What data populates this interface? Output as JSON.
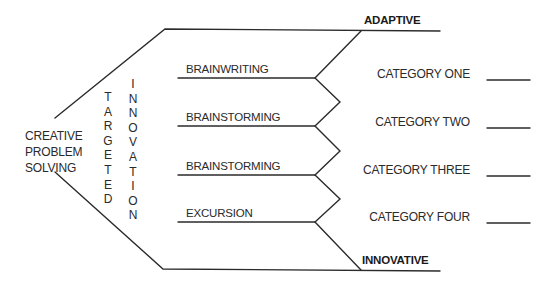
{
  "diagram": {
    "type": "process-flow",
    "start_label": [
      "CREATIVE",
      "PROBLEM",
      "SOLVING"
    ],
    "vertical_labels": {
      "targeted": [
        "T",
        "A",
        "R",
        "G",
        "E",
        "T",
        "E",
        "D"
      ],
      "innovation": [
        "I",
        "N",
        "N",
        "O",
        "V",
        "A",
        "T",
        "I",
        "O",
        "N"
      ]
    },
    "top_label": "ADAPTIVE",
    "bottom_label": "INNOVATIVE",
    "techniques": [
      {
        "label": "BRAINWRITING"
      },
      {
        "label": "BRAINSTORMING"
      },
      {
        "label": "BRAINSTORMING"
      },
      {
        "label": "EXCURSION"
      }
    ],
    "categories": [
      {
        "label": "CATEGORY ONE",
        "value": ""
      },
      {
        "label": "CATEGORY TWO",
        "value": ""
      },
      {
        "label": "CATEGORY THREE",
        "value": ""
      },
      {
        "label": "CATEGORY FOUR",
        "value": ""
      }
    ],
    "line_color": "#2b2b2b"
  }
}
